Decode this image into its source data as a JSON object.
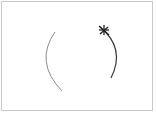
{
  "diagram": {
    "colors": {
      "frame_border": "#c8c8c8",
      "left_arc": "#8c8c8c",
      "right_arc": "#3a3a3a",
      "marker": "#222222",
      "background": "#ffffff"
    },
    "elements": [
      {
        "id": "left-arc",
        "kind": "arc",
        "opens": "right"
      },
      {
        "id": "right-arc",
        "kind": "arc",
        "opens": "left"
      },
      {
        "id": "marker",
        "kind": "starburst",
        "attached_to": "right-arc",
        "position": "top-end"
      }
    ]
  }
}
